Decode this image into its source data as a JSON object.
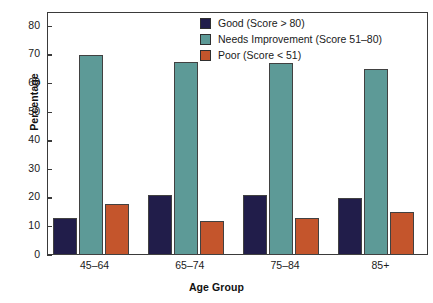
{
  "chart_data": {
    "type": "bar",
    "title": "",
    "xlabel": "Age Group",
    "ylabel": "Percentage",
    "categories": [
      "45–64",
      "65–74",
      "75–84",
      "85+"
    ],
    "series": [
      {
        "name": "Good (Score > 80)",
        "color": "#211d4a",
        "values": [
          13,
          21,
          21,
          20
        ]
      },
      {
        "name": "Needs Improvement (Score 51–80)",
        "color": "#5d9a97",
        "values": [
          70,
          67.5,
          67,
          65
        ]
      },
      {
        "name": "Poor (Score < 51)",
        "color": "#c4552c",
        "values": [
          18,
          12,
          13,
          15
        ]
      }
    ],
    "ylim": [
      0,
      85
    ],
    "yticks": [
      0,
      10,
      20,
      30,
      40,
      50,
      60,
      70,
      80
    ],
    "ytick_labels": [
      "0",
      "10",
      "20",
      "30",
      "40",
      "50",
      "60",
      "70",
      "80"
    ],
    "grid": false,
    "legend_position": "top-right-inside"
  }
}
